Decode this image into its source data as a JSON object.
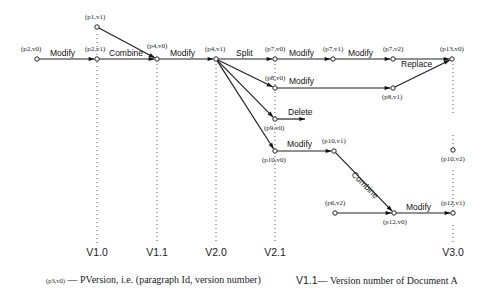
{
  "diagram": {
    "nodes": [
      {
        "id": "p2v0",
        "label": "(p2,v0)",
        "x": 37,
        "y": 59,
        "lx": 21,
        "ly": 51
      },
      {
        "id": "p1v1",
        "label": "(p1,v1)",
        "x": 97,
        "y": 27,
        "lx": 85,
        "ly": 19
      },
      {
        "id": "p2v1",
        "label": "(p2,v1)",
        "x": 97,
        "y": 59,
        "lx": 85,
        "ly": 51
      },
      {
        "id": "p4v0",
        "label": "(p4,v0)",
        "x": 157,
        "y": 59,
        "lx": 147,
        "ly": 48
      },
      {
        "id": "p4v1",
        "label": "(p4,v1)",
        "x": 216,
        "y": 59,
        "lx": 205,
        "ly": 51
      },
      {
        "id": "p7v0",
        "label": "(p7,v0)",
        "x": 275,
        "y": 59,
        "lx": 265,
        "ly": 51
      },
      {
        "id": "p7v1",
        "label": "(p7,v1)",
        "x": 333,
        "y": 59,
        "lx": 323,
        "ly": 51
      },
      {
        "id": "p7v2",
        "label": "(p7,v2)",
        "x": 393,
        "y": 59,
        "lx": 383,
        "ly": 51
      },
      {
        "id": "p13v0",
        "label": "(p13,v0)",
        "x": 452,
        "y": 59,
        "lx": 440,
        "ly": 51
      },
      {
        "id": "p8v0",
        "label": "(p8,v0)",
        "x": 275,
        "y": 88,
        "lx": 265,
        "ly": 80
      },
      {
        "id": "p8v1",
        "label": "(p8,v1)",
        "x": 393,
        "y": 88,
        "lx": 382,
        "ly": 99
      },
      {
        "id": "p9v0",
        "label": "(p9,v0)",
        "x": 275,
        "y": 119,
        "lx": 264,
        "ly": 130
      },
      {
        "id": "p10v0",
        "label": "(p10,v0)",
        "x": 275,
        "y": 151,
        "lx": 262,
        "ly": 162
      },
      {
        "id": "p10v1",
        "label": "(p10,v1)",
        "x": 334,
        "y": 151,
        "lx": 322,
        "ly": 143
      },
      {
        "id": "p10v2",
        "label": "(p10,v2)",
        "x": 453,
        "y": 150,
        "lx": 441,
        "ly": 161
      },
      {
        "id": "p6v2",
        "label": "(p6,v2)",
        "x": 335,
        "y": 213,
        "lx": 325,
        "ly": 205
      },
      {
        "id": "p12v0",
        "label": "(p12,v0)",
        "x": 394,
        "y": 213,
        "lx": 383,
        "ly": 224
      },
      {
        "id": "p12v1",
        "label": "(p12,v1)",
        "x": 453,
        "y": 213,
        "lx": 441,
        "ly": 205
      }
    ],
    "edges": [
      {
        "from": "p2v0",
        "to": "p2v1",
        "label": "Modify",
        "lx": 50,
        "ly": 56,
        "rot": 0
      },
      {
        "from": "p2v1",
        "to": "p4v0",
        "label": "Combine",
        "lx": 109,
        "ly": 56,
        "rot": 0
      },
      {
        "from": "p1v1",
        "to": "p4v0",
        "label": "",
        "lx": 0,
        "ly": 0,
        "rot": 0
      },
      {
        "from": "p4v0",
        "to": "p4v1",
        "label": "Modify",
        "lx": 170,
        "ly": 56,
        "rot": 0
      },
      {
        "from": "p4v1",
        "to": "p7v0",
        "label": "Split",
        "lx": 236,
        "ly": 56,
        "rot": 0
      },
      {
        "from": "p4v1",
        "to": "p8v0",
        "label": "",
        "lx": 0,
        "ly": 0,
        "rot": 0
      },
      {
        "from": "p4v1",
        "to": "p9v0",
        "label": "",
        "lx": 0,
        "ly": 0,
        "rot": 0
      },
      {
        "from": "p4v1",
        "to": "p10v0",
        "label": "",
        "lx": 0,
        "ly": 0,
        "rot": 0
      },
      {
        "from": "p7v0",
        "to": "p7v1",
        "label": "Modify",
        "lx": 289,
        "ly": 56,
        "rot": 0
      },
      {
        "from": "p7v1",
        "to": "p7v2",
        "label": "Modify",
        "lx": 348,
        "ly": 56,
        "rot": 0
      },
      {
        "from": "p7v2",
        "to": "p13v0",
        "label": "Replace",
        "lx": 401,
        "ly": 67,
        "rot": 0
      },
      {
        "from": "p8v0",
        "to": "p8v1",
        "label": "Modify",
        "lx": 289,
        "ly": 84,
        "rot": 0
      },
      {
        "from": "p8v1",
        "to": "p13v0",
        "label": "",
        "lx": 0,
        "ly": 0,
        "rot": 0
      },
      {
        "from": "p10v0",
        "to": "p10v1",
        "label": "Modify",
        "lx": 287,
        "ly": 147,
        "rot": 0
      },
      {
        "from": "p10v1",
        "to": "p12v0",
        "label": "Combine",
        "lx": 351,
        "ly": 175,
        "rot": 45
      },
      {
        "from": "p6v2",
        "to": "p12v0",
        "label": "",
        "lx": 0,
        "ly": 0,
        "rot": 0
      },
      {
        "from": "p12v0",
        "to": "p12v1",
        "label": "Modify",
        "lx": 406,
        "ly": 210,
        "rot": 0
      }
    ],
    "open_arrows": [
      {
        "from": "p9v0",
        "x2": 305,
        "y2": 119,
        "label": "Delete",
        "lx": 288,
        "ly": 115
      }
    ],
    "versions": [
      {
        "label": "V1.0",
        "x": 97,
        "y1": 34,
        "y2": 244,
        "gaps": []
      },
      {
        "label": "V1.1",
        "x": 157,
        "y1": 64,
        "y2": 244,
        "gaps": []
      },
      {
        "label": "V2.0",
        "x": 216,
        "y1": 64,
        "y2": 244,
        "gaps": []
      },
      {
        "label": "V2.1",
        "x": 275,
        "y1": 64,
        "y2": 244,
        "gaps": []
      },
      {
        "label": "V3.0",
        "x": 453,
        "y1": 64,
        "y2": 244,
        "gaps": [
          [
            115,
            135
          ],
          [
            155,
            170
          ],
          [
            217,
            225
          ]
        ]
      }
    ],
    "version_label_y": 252
  },
  "legend": {
    "pversion_sample": "(p3,v0)",
    "pversion_dash": "—",
    "pversion_text": "PVersion, i.e. (paragraph Id, version number)",
    "version_sample": "V1.1",
    "version_dash": "—",
    "version_text": "Version number of Document A"
  }
}
